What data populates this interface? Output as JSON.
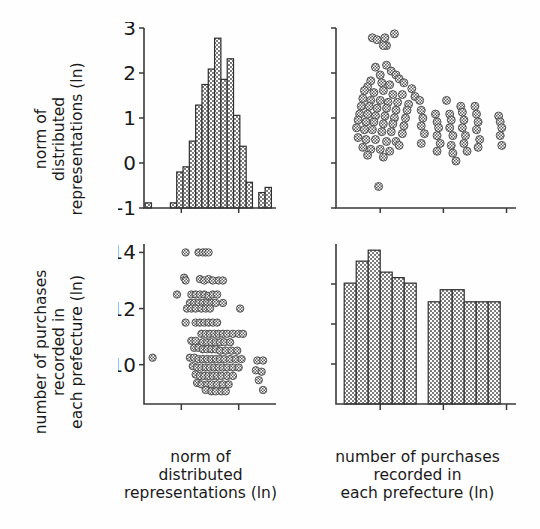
{
  "figure": {
    "type": "scatter-plot-matrix",
    "background": "#fefefe",
    "ink_color": "#2f2f2f"
  },
  "labels": {
    "var1_line1": "norm of",
    "var1_line2": "distributed",
    "var1_line3": "representations (ln)",
    "var2_line1": "number of purchases",
    "var2_line2": "recorded in",
    "var2_line3": "each prefecture (ln)"
  },
  "ticks": {
    "var1": [
      "-1",
      "0",
      "1",
      "2",
      "3"
    ],
    "var1_x_shown": [
      "0",
      "2"
    ],
    "var2": [
      "10",
      "12",
      "14"
    ]
  },
  "chart_data": [
    {
      "id": "top-left",
      "type": "bar",
      "title": "",
      "xlabel": "norm of distributed representations (ln)",
      "ylabel": "count",
      "orientation": "histogram",
      "xlim": [
        -1.3,
        3.3
      ],
      "bin_width": 0.22,
      "bin_centers": [
        -1.15,
        -0.93,
        -0.71,
        -0.49,
        -0.27,
        -0.05,
        0.17,
        0.39,
        0.61,
        0.83,
        1.05,
        1.27,
        1.49,
        1.71,
        1.93,
        2.15,
        2.37,
        2.59,
        2.81,
        3.03
      ],
      "values": [
        1,
        0,
        0,
        0,
        1,
        7,
        8,
        13,
        20,
        24,
        27,
        33,
        25,
        29,
        18,
        12,
        5,
        0,
        3,
        4
      ],
      "grid": false
    },
    {
      "id": "top-right",
      "type": "scatter",
      "title": "",
      "xlabel": "number of purchases recorded in each prefecture (ln)",
      "ylabel": "norm of distributed representations (ln)",
      "xlim": [
        8.6,
        14.3
      ],
      "ylim": [
        -1.3,
        3.3
      ],
      "correlation": "negative",
      "marker": "circle-hatched",
      "note": "vertical banding at discrete x values; one low outlier near x=9.9,y=-0.75; cluster of high points near y=3",
      "points": [
        [
          9.75,
          3.05
        ],
        [
          9.9,
          3.0
        ],
        [
          10.15,
          3.05
        ],
        [
          10.2,
          2.85
        ],
        [
          10.45,
          3.15
        ],
        [
          10.1,
          2.85
        ],
        [
          9.85,
          2.3
        ],
        [
          10.2,
          2.35
        ],
        [
          10.35,
          2.2
        ],
        [
          10.0,
          2.1
        ],
        [
          10.5,
          2.1
        ],
        [
          10.6,
          2.0
        ],
        [
          9.7,
          1.95
        ],
        [
          10.05,
          1.9
        ],
        [
          10.3,
          1.85
        ],
        [
          10.75,
          1.9
        ],
        [
          11.0,
          1.75
        ],
        [
          9.6,
          1.8
        ],
        [
          9.5,
          1.7
        ],
        [
          9.8,
          1.65
        ],
        [
          10.1,
          1.7
        ],
        [
          10.4,
          1.6
        ],
        [
          10.7,
          1.6
        ],
        [
          11.1,
          1.55
        ],
        [
          9.45,
          1.5
        ],
        [
          9.7,
          1.45
        ],
        [
          10.0,
          1.45
        ],
        [
          10.25,
          1.4
        ],
        [
          10.55,
          1.4
        ],
        [
          10.9,
          1.35
        ],
        [
          9.4,
          1.3
        ],
        [
          9.65,
          1.3
        ],
        [
          9.9,
          1.25
        ],
        [
          10.2,
          1.25
        ],
        [
          10.5,
          1.2
        ],
        [
          10.85,
          1.2
        ],
        [
          9.35,
          1.1
        ],
        [
          9.6,
          1.1
        ],
        [
          9.85,
          1.05
        ],
        [
          10.15,
          1.05
        ],
        [
          10.45,
          1.0
        ],
        [
          10.8,
          1.0
        ],
        [
          9.3,
          0.95
        ],
        [
          9.55,
          0.9
        ],
        [
          9.8,
          0.9
        ],
        [
          10.1,
          0.85
        ],
        [
          10.4,
          0.85
        ],
        [
          10.75,
          0.8
        ],
        [
          9.25,
          0.75
        ],
        [
          9.5,
          0.7
        ],
        [
          9.75,
          0.7
        ],
        [
          10.05,
          0.65
        ],
        [
          10.35,
          0.65
        ],
        [
          10.7,
          0.6
        ],
        [
          9.3,
          0.5
        ],
        [
          9.55,
          0.45
        ],
        [
          9.85,
          0.45
        ],
        [
          10.2,
          0.4
        ],
        [
          10.5,
          0.4
        ],
        [
          10.6,
          0.3
        ],
        [
          9.45,
          0.25
        ],
        [
          9.7,
          0.2
        ],
        [
          10.0,
          0.2
        ],
        [
          10.3,
          0.15
        ],
        [
          9.6,
          0.05
        ],
        [
          10.1,
          0.0
        ],
        [
          11.25,
          1.45
        ],
        [
          11.3,
          1.2
        ],
        [
          11.35,
          1.0
        ],
        [
          11.3,
          0.8
        ],
        [
          11.4,
          0.6
        ],
        [
          11.3,
          0.35
        ],
        [
          11.75,
          1.1
        ],
        [
          11.8,
          0.9
        ],
        [
          11.85,
          0.75
        ],
        [
          11.8,
          0.55
        ],
        [
          11.9,
          0.35
        ],
        [
          11.8,
          0.15
        ],
        [
          12.1,
          1.45
        ],
        [
          12.2,
          1.1
        ],
        [
          12.25,
          0.95
        ],
        [
          12.2,
          0.75
        ],
        [
          12.3,
          0.55
        ],
        [
          12.25,
          0.3
        ],
        [
          12.3,
          0.1
        ],
        [
          12.4,
          -0.1
        ],
        [
          12.55,
          1.3
        ],
        [
          12.6,
          1.15
        ],
        [
          12.65,
          0.95
        ],
        [
          12.6,
          0.75
        ],
        [
          12.7,
          0.55
        ],
        [
          12.65,
          0.35
        ],
        [
          12.75,
          0.15
        ],
        [
          13.0,
          1.3
        ],
        [
          13.05,
          1.1
        ],
        [
          13.1,
          0.9
        ],
        [
          13.05,
          0.7
        ],
        [
          13.15,
          0.45
        ],
        [
          13.1,
          0.25
        ],
        [
          13.75,
          1.05
        ],
        [
          13.8,
          0.9
        ],
        [
          13.85,
          0.75
        ],
        [
          13.8,
          0.55
        ],
        [
          13.85,
          0.3
        ],
        [
          9.95,
          -0.75
        ]
      ]
    },
    {
      "id": "bottom-left",
      "type": "scatter",
      "title": "",
      "xlabel": "norm of distributed representations (ln)",
      "ylabel": "number of purchases recorded in each prefecture (ln)",
      "xlim": [
        -1.3,
        3.3
      ],
      "ylim": [
        8.6,
        14.3
      ],
      "correlation": "negative",
      "marker": "circle-hatched",
      "note": "horizontal banding at discrete y values; one far-left outlier near x=-1.0,y=10.2",
      "points": [
        [
          0.15,
          14.0
        ],
        [
          0.6,
          14.0
        ],
        [
          0.75,
          14.0
        ],
        [
          0.85,
          14.0
        ],
        [
          0.95,
          14.0
        ],
        [
          0.1,
          13.1
        ],
        [
          0.15,
          13.0
        ],
        [
          0.65,
          13.05
        ],
        [
          0.8,
          13.0
        ],
        [
          0.95,
          13.05
        ],
        [
          1.1,
          13.0
        ],
        [
          1.3,
          13.0
        ],
        [
          1.45,
          13.0
        ],
        [
          -0.15,
          12.5
        ],
        [
          0.35,
          12.5
        ],
        [
          0.5,
          12.5
        ],
        [
          0.65,
          12.5
        ],
        [
          0.8,
          12.5
        ],
        [
          0.95,
          12.45
        ],
        [
          1.1,
          12.5
        ],
        [
          1.25,
          12.5
        ],
        [
          0.3,
          12.2
        ],
        [
          0.45,
          12.2
        ],
        [
          0.6,
          12.2
        ],
        [
          0.75,
          12.2
        ],
        [
          0.9,
          12.2
        ],
        [
          1.05,
          12.2
        ],
        [
          1.2,
          12.2
        ],
        [
          1.45,
          12.2
        ],
        [
          0.2,
          12.0
        ],
        [
          0.35,
          12.0
        ],
        [
          0.5,
          12.0
        ],
        [
          0.7,
          12.0
        ],
        [
          0.85,
          12.0
        ],
        [
          1.0,
          12.0
        ],
        [
          2.05,
          12.0
        ],
        [
          0.15,
          11.5
        ],
        [
          0.5,
          11.5
        ],
        [
          0.65,
          11.5
        ],
        [
          0.8,
          11.5
        ],
        [
          0.95,
          11.5
        ],
        [
          1.1,
          11.5
        ],
        [
          1.25,
          11.5
        ],
        [
          0.7,
          11.1
        ],
        [
          0.85,
          11.1
        ],
        [
          1.0,
          11.1
        ],
        [
          1.15,
          11.1
        ],
        [
          1.3,
          11.1
        ],
        [
          1.45,
          11.1
        ],
        [
          1.6,
          11.1
        ],
        [
          1.8,
          11.1
        ],
        [
          2.0,
          11.1
        ],
        [
          2.15,
          11.1
        ],
        [
          0.35,
          10.85
        ],
        [
          0.5,
          10.85
        ],
        [
          0.75,
          10.8
        ],
        [
          0.9,
          10.8
        ],
        [
          1.05,
          10.8
        ],
        [
          1.2,
          10.8
        ],
        [
          1.35,
          10.8
        ],
        [
          1.5,
          10.8
        ],
        [
          1.7,
          10.8
        ],
        [
          0.45,
          10.6
        ],
        [
          0.6,
          10.6
        ],
        [
          0.75,
          10.55
        ],
        [
          0.9,
          10.55
        ],
        [
          1.05,
          10.55
        ],
        [
          1.2,
          10.55
        ],
        [
          1.35,
          10.5
        ],
        [
          1.55,
          10.5
        ],
        [
          1.75,
          10.5
        ],
        [
          1.95,
          10.5
        ],
        [
          0.3,
          10.25
        ],
        [
          0.45,
          10.25
        ],
        [
          0.6,
          10.2
        ],
        [
          0.75,
          10.2
        ],
        [
          0.9,
          10.2
        ],
        [
          1.05,
          10.2
        ],
        [
          1.2,
          10.2
        ],
        [
          1.35,
          10.2
        ],
        [
          1.5,
          10.2
        ],
        [
          1.7,
          10.2
        ],
        [
          1.9,
          10.2
        ],
        [
          2.1,
          10.2
        ],
        [
          0.4,
          9.95
        ],
        [
          0.55,
          9.9
        ],
        [
          0.7,
          9.9
        ],
        [
          0.85,
          9.9
        ],
        [
          1.0,
          9.9
        ],
        [
          1.15,
          9.9
        ],
        [
          1.3,
          9.9
        ],
        [
          1.45,
          9.9
        ],
        [
          1.6,
          9.9
        ],
        [
          1.8,
          9.9
        ],
        [
          2.0,
          9.9
        ],
        [
          0.5,
          9.65
        ],
        [
          0.65,
          9.6
        ],
        [
          0.8,
          9.6
        ],
        [
          0.95,
          9.6
        ],
        [
          1.1,
          9.6
        ],
        [
          1.25,
          9.6
        ],
        [
          1.4,
          9.6
        ],
        [
          1.6,
          9.6
        ],
        [
          1.8,
          9.6
        ],
        [
          0.55,
          9.35
        ],
        [
          0.7,
          9.3
        ],
        [
          0.9,
          9.3
        ],
        [
          1.05,
          9.3
        ],
        [
          1.25,
          9.3
        ],
        [
          1.45,
          9.3
        ],
        [
          1.65,
          9.3
        ],
        [
          0.85,
          9.1
        ],
        [
          1.05,
          9.05
        ],
        [
          1.2,
          9.05
        ],
        [
          1.4,
          9.05
        ],
        [
          1.55,
          9.05
        ],
        [
          2.65,
          10.15
        ],
        [
          2.85,
          10.15
        ],
        [
          2.6,
          9.8
        ],
        [
          2.8,
          9.75
        ],
        [
          2.7,
          9.45
        ],
        [
          2.85,
          9.1
        ],
        [
          -1.0,
          10.25
        ]
      ]
    },
    {
      "id": "bottom-right",
      "type": "bar",
      "title": "",
      "xlabel": "number of purchases recorded in each prefecture (ln)",
      "ylabel": "count",
      "orientation": "histogram",
      "xlim": [
        8.6,
        14.3
      ],
      "bin_width": 0.38,
      "bin_centers": [
        9.05,
        9.43,
        9.81,
        10.19,
        10.57,
        10.95,
        11.33,
        11.71,
        12.09,
        12.47,
        12.85,
        13.23,
        13.61
      ],
      "values": [
        11,
        13,
        14,
        12,
        11.5,
        11,
        0,
        9.3,
        10.4,
        10.4,
        9.3,
        9.3,
        9.3
      ],
      "grid": false
    }
  ]
}
